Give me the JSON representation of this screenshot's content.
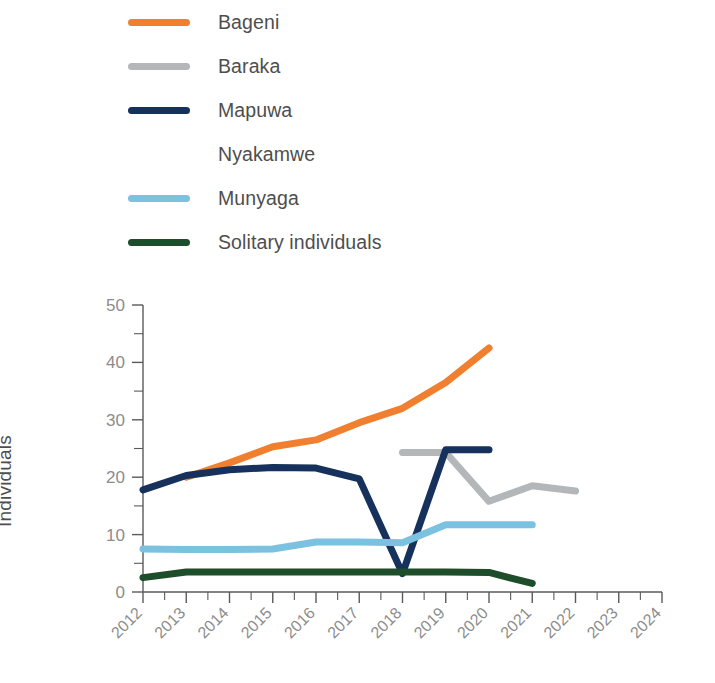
{
  "legend": {
    "position": "top-left",
    "items": [
      {
        "label": "Bageni",
        "color": "#F08030",
        "key": "bageni"
      },
      {
        "label": "Baraka",
        "color": "#B3B7BA",
        "key": "baraka"
      },
      {
        "label": "Mapuwa",
        "color": "#16325C",
        "key": "mapuwa"
      },
      {
        "label": "Nyakamwe",
        "color": "#FFFFFF",
        "key": "nyakamwe"
      },
      {
        "label": "Munyaga",
        "color": "#7BC2E0",
        "key": "munyaga"
      },
      {
        "label": "Solitary individuals",
        "color": "#1E4D2B",
        "key": "solitary"
      }
    ]
  },
  "axes": {
    "ylabel": "Individuals",
    "xlabel": "",
    "ytick_labels": [
      "0",
      "10",
      "20",
      "30",
      "40",
      "50"
    ],
    "xtick_labels": [
      "2012",
      "2013",
      "2014",
      "2015",
      "2016",
      "2017",
      "2018",
      "2019",
      "2020",
      "2021",
      "2022",
      "2023",
      "2024"
    ]
  },
  "chart_data": {
    "type": "line",
    "title": "",
    "xlabel": "",
    "ylabel": "Individuals",
    "xlim": [
      2012,
      2024
    ],
    "ylim": [
      0,
      50
    ],
    "ytick_major": [
      0,
      10,
      20,
      30,
      40,
      50
    ],
    "ytick_minor_step": 5,
    "xticks": [
      2012,
      2013,
      2014,
      2015,
      2016,
      2017,
      2018,
      2019,
      2020,
      2021,
      2022,
      2023,
      2024
    ],
    "xtick_minor_step": 0.5,
    "grid": false,
    "legend_position": "above-plot",
    "series": [
      {
        "name": "Bageni",
        "color": "#F08030",
        "x": [
          2013,
          2014,
          2015,
          2016,
          2017,
          2018,
          2019,
          2020
        ],
        "values": [
          20.0,
          22.5,
          25.3,
          26.5,
          29.5,
          32.0,
          36.5,
          42.5
        ]
      },
      {
        "name": "Baraka",
        "color": "#B3B7BA",
        "x": [
          2018,
          2019,
          2020,
          2021,
          2022
        ],
        "values": [
          24.3,
          24.3,
          15.8,
          18.5,
          17.6
        ]
      },
      {
        "name": "Mapuwa",
        "color": "#16325C",
        "x": [
          2012,
          2013,
          2014,
          2015,
          2016,
          2017,
          2018,
          2019,
          2020
        ],
        "values": [
          17.8,
          20.3,
          21.3,
          21.7,
          21.6,
          19.7,
          3.2,
          24.8,
          24.8
        ]
      },
      {
        "name": "Nyakamwe",
        "color": "#FFFFFF",
        "x": [],
        "values": []
      },
      {
        "name": "Munyaga",
        "color": "#7BC2E0",
        "x": [
          2012,
          2013,
          2014,
          2015,
          2016,
          2017,
          2018,
          2019,
          2020,
          2021
        ],
        "values": [
          7.5,
          7.4,
          7.4,
          7.5,
          8.7,
          8.7,
          8.6,
          11.7,
          11.7,
          11.7
        ]
      },
      {
        "name": "Solitary individuals",
        "color": "#1E4D2B",
        "x": [
          2012,
          2013,
          2014,
          2015,
          2016,
          2017,
          2018,
          2019,
          2020,
          2021
        ],
        "values": [
          2.5,
          3.5,
          3.5,
          3.5,
          3.5,
          3.5,
          3.5,
          3.5,
          3.4,
          1.5
        ]
      }
    ]
  }
}
